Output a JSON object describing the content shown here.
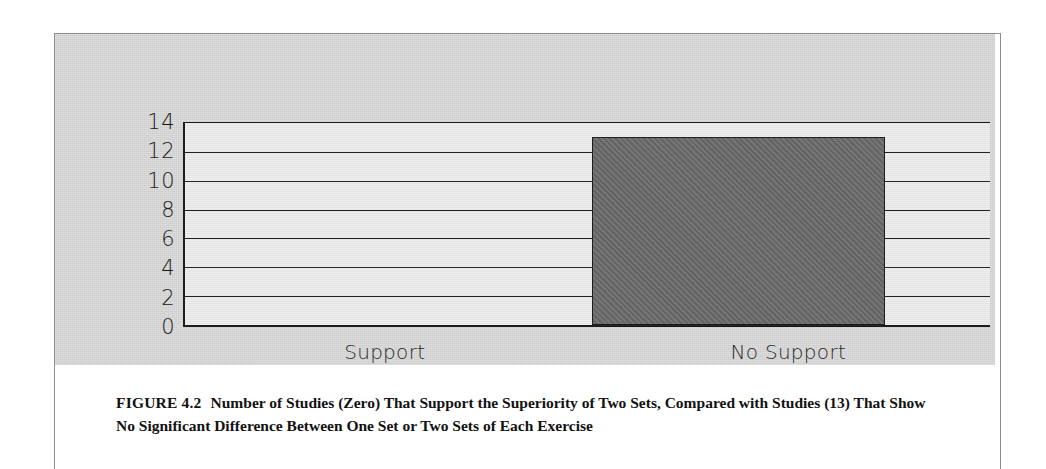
{
  "figure": {
    "label": "FIGURE 4.2",
    "caption": "Number of Studies (Zero) That Support the Superiority of Two Sets, Compared with Studies (13) That Show No Significant Difference Between One Set or Two Sets of Each Exercise"
  },
  "colors": {
    "page_background": "#ffffff",
    "panel_background": "#d7d7d7",
    "plot_background": "#eaeaea",
    "bar_fill": "#6b6b6b",
    "bar_outline": "#1e1e1e",
    "gridline": "#232323",
    "axis": "#1d1d1d",
    "tick_text": "#1b1b1b",
    "caption_text": "#121212",
    "frame_rule": "#8e8e91"
  },
  "chart_data": {
    "type": "bar",
    "title": "",
    "xlabel": "",
    "ylabel": "",
    "categories": [
      "Support",
      "No Support"
    ],
    "values": [
      0,
      13
    ],
    "ylim": [
      0,
      14
    ],
    "yticks": [
      14,
      12,
      10,
      8,
      6,
      4,
      2,
      0
    ],
    "ytick_labels": [
      "14",
      "12",
      "10",
      "8",
      "6",
      "4",
      "2",
      "0"
    ],
    "grid": true,
    "grid_axis": "y",
    "legend": false,
    "legend_position": "none",
    "series": [
      {
        "name": "Number of Studies",
        "values": [
          0,
          13
        ]
      }
    ],
    "annotations": []
  }
}
